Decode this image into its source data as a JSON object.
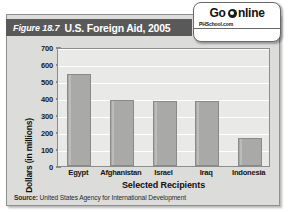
{
  "figure": {
    "number": "Figure 18.7",
    "title": "U.S. Foreign Aid, 2005",
    "source_prefix": "Source:",
    "source_text": "United States Agency for International Development"
  },
  "badge": {
    "go_label": "Go",
    "online_label": "nline",
    "o_icon": "globe-icon",
    "site": "PHSchool.com",
    "web_code": "Web Code: mng-7185"
  },
  "colors": {
    "title_bar": "#59595a",
    "card": "#dcdcda",
    "plot_bg": "#e9e9e7",
    "bar": "#a9a9a7",
    "bar_border": "#8a8a88",
    "gridline": "#ffffff",
    "text": "#111111"
  },
  "chart_data": {
    "type": "bar",
    "title": "U.S. Foreign Aid, 2005",
    "xlabel": "Selected Recipients",
    "ylabel": "Dollars (in millions)",
    "categories": [
      "Egypt",
      "Afghanistan",
      "Israel",
      "Iraq",
      "Indonesia"
    ],
    "values": [
      540,
      390,
      385,
      380,
      165
    ],
    "ylim": [
      0,
      700
    ],
    "yticks": [
      0,
      100,
      200,
      300,
      400,
      500,
      600,
      700
    ],
    "ytick_labels": [
      "0",
      "100",
      "200",
      "300",
      "400",
      "500",
      "600",
      "700"
    ],
    "grid": true,
    "legend": "none",
    "source": "Source: United States Agency for International Development"
  }
}
